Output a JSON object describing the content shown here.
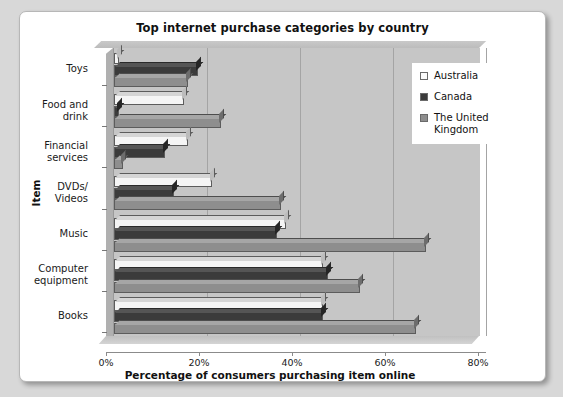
{
  "card": {
    "title": "Top internet purchase categories by country"
  },
  "axes": {
    "y_title": "Item",
    "x_title": "Percentage of consumers purchasing item online",
    "x_ticks": [
      "0%",
      "20%",
      "40%",
      "60%",
      "80%"
    ]
  },
  "legend": {
    "items": [
      {
        "label": "Australia",
        "swatch": "#f5f5f5",
        "key": "au"
      },
      {
        "label": "Canada",
        "swatch": "#3b3b3b",
        "key": "ca"
      },
      {
        "label": "The United Kingdom",
        "swatch": "#8e8e8e",
        "key": "uk"
      }
    ]
  },
  "chart_data": {
    "type": "bar",
    "orientation": "horizontal",
    "title": "Top internet purchase categories by country",
    "xlabel": "Percentage of consumers purchasing item online",
    "ylabel": "Item",
    "xlim": [
      0,
      80
    ],
    "xticks": [
      0,
      20,
      40,
      60,
      80
    ],
    "grid": true,
    "legend_position": "right",
    "categories": [
      "Toys",
      "Food and drink",
      "Financial services",
      "DVDs/ Videos",
      "Music",
      "Computer equipment",
      "Books"
    ],
    "series": [
      {
        "name": "Australia",
        "color": "#f5f5f5",
        "values": [
          1,
          15,
          16,
          21,
          37,
          45,
          45
        ]
      },
      {
        "name": "Canada",
        "color": "#3b3b3b",
        "values": [
          18,
          1,
          11,
          13,
          35,
          46,
          45
        ]
      },
      {
        "name": "The United Kingdom",
        "color": "#8e8e8e",
        "values": [
          16,
          23,
          2,
          36,
          67,
          53,
          65
        ]
      }
    ]
  }
}
